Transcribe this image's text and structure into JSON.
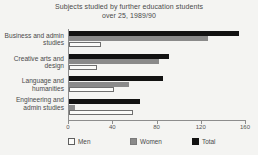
{
  "title": {
    "line1": "Subjects studied by further education students",
    "line2": "over 25, 1989/90"
  },
  "legend": [
    {
      "key": "men",
      "label": "Men",
      "color": "#fbfbf9"
    },
    {
      "key": "women",
      "label": "Women",
      "color": "#8a8a8a"
    },
    {
      "key": "total",
      "label": "Total",
      "color": "#121212"
    }
  ],
  "chart_data": {
    "type": "bar",
    "orientation": "horizontal",
    "title": "Subjects studied by further education students over 25, 1989/90",
    "xlabel": "",
    "ylabel": "",
    "xlim": [
      0,
      160
    ],
    "xticks": [
      0,
      40,
      80,
      120,
      160
    ],
    "grid": false,
    "legend_position": "bottom",
    "categories": [
      "Business and admin studies",
      "Creative arts and design",
      "Language and humanities",
      "Engineering and admin studies"
    ],
    "series": [
      {
        "name": "Men",
        "color": "#fbfbf9",
        "values": [
          29,
          25,
          41,
          58
        ]
      },
      {
        "name": "Women",
        "color": "#8a8a8a",
        "values": [
          126,
          81,
          54,
          5
        ]
      },
      {
        "name": "Total",
        "color": "#121212",
        "values": [
          154,
          90,
          85,
          64
        ]
      }
    ]
  }
}
